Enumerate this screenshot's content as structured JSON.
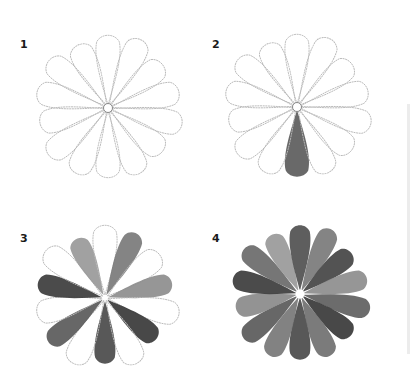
{
  "steps": [
    {
      "number": "1",
      "label_pos": [
        20,
        45
      ],
      "center": [
        108,
        108
      ],
      "description": "pencil outline of 14-petal flower"
    },
    {
      "number": "2",
      "label_pos": [
        212,
        45
      ],
      "center": [
        297,
        107
      ],
      "description": "outline with one bottom petal painted"
    },
    {
      "number": "3",
      "label_pos": [
        20,
        236
      ],
      "center": [
        105,
        298
      ],
      "description": "alternate petals painted, outlines remaining"
    },
    {
      "number": "4",
      "label_pos": [
        212,
        236
      ],
      "center": [
        300,
        294
      ],
      "description": "all petals painted"
    }
  ],
  "colors": {
    "outline": "#b9b9b9",
    "paint_dark": "#3f3f3f",
    "paint_mid": "#6e6e6e",
    "paint_light": "#9a9a9a",
    "background": "#ffffff"
  }
}
